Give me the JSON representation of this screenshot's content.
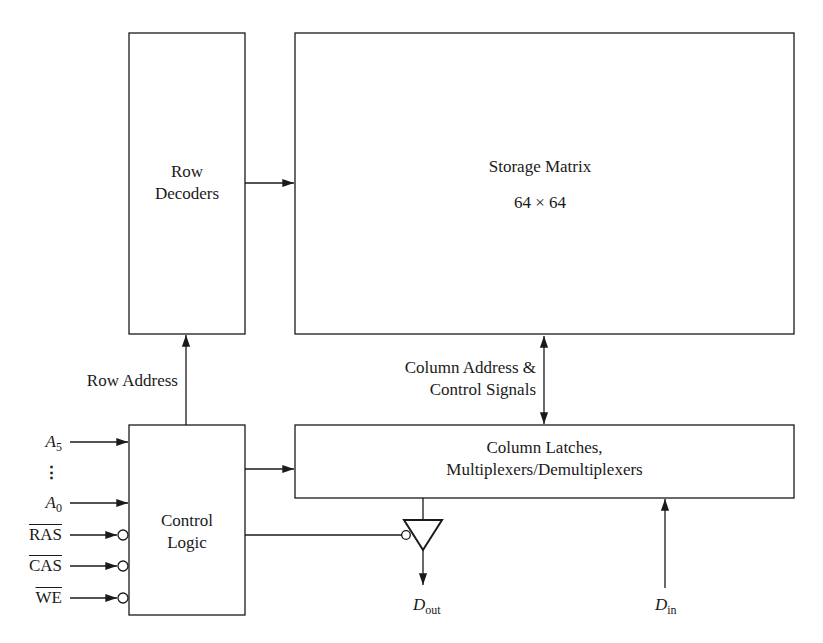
{
  "diagram": {
    "blocks": {
      "row_decoders": {
        "line1": "Row",
        "line2": "Decoders"
      },
      "storage_matrix": {
        "title": "Storage Matrix",
        "size": "64 × 64"
      },
      "control_logic": {
        "line1": "Control",
        "line2": "Logic"
      },
      "column_block": {
        "line1": "Column Latches,",
        "line2": "Multiplexers/Demultiplexers"
      }
    },
    "signals": {
      "row_address": "Row Address",
      "column_address_line1": "Column Address &",
      "column_address_line2": "Control Signals",
      "inputs": [
        {
          "main": "A",
          "sub": "5",
          "active_low": false
        },
        {
          "main": "⋮",
          "sub": "",
          "active_low": false
        },
        {
          "main": "A",
          "sub": "0",
          "active_low": false
        },
        {
          "main": "RAS",
          "sub": "",
          "active_low": true
        },
        {
          "main": "CAS",
          "sub": "",
          "active_low": true
        },
        {
          "main": "WE",
          "sub": "",
          "active_low": true
        }
      ],
      "dout": {
        "main": "D",
        "sub": "out"
      },
      "din": {
        "main": "D",
        "sub": "in"
      }
    },
    "colors": {
      "line": "#1a1a1a",
      "background": "#ffffff"
    }
  }
}
